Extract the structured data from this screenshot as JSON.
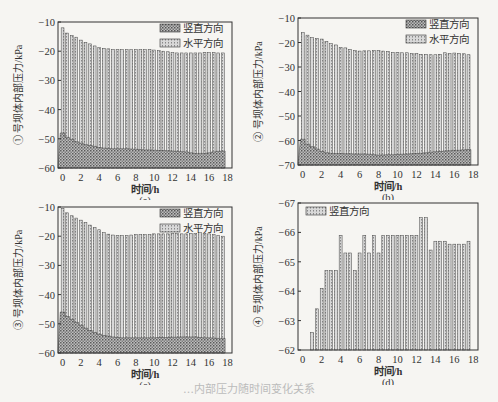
{
  "chart_data": [
    {
      "id": "a",
      "type": "bar",
      "title": "",
      "panel_label": "(a)",
      "xlabel": "时间/h",
      "ylabel": "① 号坝体内部压力/kPa",
      "ylim": [
        -60,
        -10
      ],
      "yticks": [
        -60,
        -50,
        -40,
        -30,
        -20,
        -10
      ],
      "xticks": [
        0,
        2,
        4,
        6,
        8,
        10,
        12,
        14,
        16,
        18
      ],
      "xlim": [
        -0.5,
        18.5
      ],
      "grid": false,
      "legend_position": "top-right",
      "legend": [
        "竖直方向",
        "水平方向"
      ],
      "x": [
        0,
        0.5,
        1,
        1.5,
        2,
        2.5,
        3,
        3.5,
        4,
        4.5,
        5,
        5.5,
        6,
        6.5,
        7,
        7.5,
        8,
        8.5,
        9,
        9.5,
        10,
        10.5,
        11,
        11.5,
        12,
        12.5,
        13,
        13.5,
        14,
        14.5,
        15,
        15.5,
        16,
        16.5,
        17,
        17.5
      ],
      "series": [
        {
          "name": "水平方向",
          "values": [
            -12,
            -13.8,
            -14.6,
            -15.2,
            -16.2,
            -17,
            -17.5,
            -18.2,
            -18.8,
            -19,
            -19.2,
            -19.4,
            -19.5,
            -19.5,
            -19.5,
            -19.5,
            -19.5,
            -19.5,
            -19.5,
            -19.4,
            -19.6,
            -19.8,
            -20,
            -20.2,
            -20.5,
            -20.6,
            -20.6,
            -20.6,
            -20.6,
            -20.6,
            -20.6,
            -20.4,
            -20.5,
            -20.5,
            -20.6,
            -20.6
          ]
        },
        {
          "name": "竖直方向",
          "values": [
            -48,
            -49.5,
            -50.2,
            -51,
            -51.5,
            -52,
            -52.3,
            -52.6,
            -53,
            -53.2,
            -53.3,
            -53.4,
            -53.4,
            -53.4,
            -53.4,
            -53.5,
            -53.6,
            -53.7,
            -53.8,
            -53.8,
            -53.9,
            -54,
            -54,
            -54.1,
            -54.2,
            -54.3,
            -54.4,
            -54.5,
            -54.8,
            -55,
            -55,
            -55,
            -54.8,
            -54.5,
            -54.3,
            -54.2
          ]
        }
      ]
    },
    {
      "id": "b",
      "type": "bar",
      "title": "",
      "panel_label": "(b)",
      "xlabel": "时间/h",
      "ylabel": "② 号坝体内部压力/kPa",
      "ylim": [
        -70,
        -10
      ],
      "yticks": [
        -70,
        -60,
        -50,
        -40,
        -30,
        -20,
        -10
      ],
      "xticks": [
        0,
        2,
        4,
        6,
        8,
        10,
        12,
        14,
        16,
        18
      ],
      "xlim": [
        -0.5,
        18.5
      ],
      "grid": false,
      "legend_position": "top-right",
      "legend": [
        "竖直方向",
        "水平方向"
      ],
      "x": [
        0,
        0.5,
        1,
        1.5,
        2,
        2.5,
        3,
        3.5,
        4,
        4.5,
        5,
        5.5,
        6,
        6.5,
        7,
        7.5,
        8,
        8.5,
        9,
        9.5,
        10,
        10.5,
        11,
        11.5,
        12,
        12.5,
        13,
        13.5,
        14,
        14.5,
        15,
        15.5,
        16,
        16.5,
        17,
        17.5
      ],
      "series": [
        {
          "name": "水平方向",
          "values": [
            -16,
            -17,
            -18,
            -18.3,
            -18.6,
            -19.5,
            -20.5,
            -21,
            -22,
            -22.2,
            -22.8,
            -23.3,
            -23.5,
            -23.4,
            -23.4,
            -23.2,
            -23.2,
            -23.5,
            -23.7,
            -24,
            -24,
            -24.2,
            -24.2,
            -24.5,
            -24.5,
            -24.8,
            -24.8,
            -25,
            -25,
            -24.8,
            -24.2,
            -24.5,
            -24.3,
            -24.4,
            -24.6,
            -25
          ]
        },
        {
          "name": "竖直方向",
          "values": [
            -59.5,
            -61.5,
            -62.5,
            -63.5,
            -64.5,
            -65,
            -65.2,
            -65.3,
            -65.3,
            -65.4,
            -65.4,
            -65.5,
            -65.5,
            -65.5,
            -65.6,
            -65.8,
            -66,
            -65.9,
            -65.8,
            -65.8,
            -65.7,
            -65.6,
            -65.5,
            -65.4,
            -65.3,
            -65.2,
            -65,
            -64.8,
            -64.6,
            -64.5,
            -64.3,
            -64.2,
            -64,
            -64,
            -63.8,
            -63.7
          ]
        }
      ]
    },
    {
      "id": "c",
      "type": "bar",
      "title": "",
      "panel_label": "(c)",
      "xlabel": "时间/h",
      "ylabel": "③ 号坝体内部压力/kPa",
      "ylim": [
        -60,
        -10
      ],
      "yticks": [
        -60,
        -50,
        -40,
        -30,
        -20,
        -10
      ],
      "xticks": [
        0,
        2,
        4,
        6,
        8,
        10,
        12,
        14,
        16,
        18
      ],
      "xlim": [
        -0.5,
        18.5
      ],
      "grid": false,
      "legend_position": "top-right",
      "legend": [
        "竖直方向",
        "水平方向"
      ],
      "x": [
        0,
        0.5,
        1,
        1.5,
        2,
        2.5,
        3,
        3.5,
        4,
        4.5,
        5,
        5.5,
        6,
        6.5,
        7,
        7.5,
        8,
        8.5,
        9,
        9.5,
        10,
        10.5,
        11,
        11.5,
        12,
        12.5,
        13,
        13.5,
        14,
        14.5,
        15,
        15.5,
        16,
        16.5,
        17,
        17.5
      ],
      "series": [
        {
          "name": "水平方向",
          "values": [
            -10.5,
            -12,
            -13,
            -13.8,
            -14.5,
            -15.3,
            -16.2,
            -17,
            -17.8,
            -18.8,
            -19.3,
            -19.6,
            -19.8,
            -19.8,
            -19.8,
            -19.6,
            -19.5,
            -19.5,
            -19.5,
            -19.5,
            -19.2,
            -19.2,
            -19.2,
            -19.2,
            -19,
            -19.1,
            -19.2,
            -19.2,
            -19,
            -19,
            -18.8,
            -19,
            -19.2,
            -19.5,
            -19.8,
            -20
          ]
        },
        {
          "name": "竖直方向",
          "values": [
            -46,
            -47.5,
            -48.5,
            -49.5,
            -50.5,
            -51.5,
            -52.3,
            -53,
            -53.6,
            -54,
            -54.2,
            -54.5,
            -54.7,
            -54.8,
            -54.8,
            -54.8,
            -54.8,
            -54.8,
            -54.8,
            -54.8,
            -54.8,
            -54.7,
            -54.7,
            -54.7,
            -54.6,
            -54.6,
            -54.5,
            -54.5,
            -54.5,
            -54.5,
            -54.7,
            -54.8,
            -54.8,
            -54.9,
            -55,
            -55
          ]
        }
      ]
    },
    {
      "id": "d",
      "type": "bar",
      "title": "",
      "panel_label": "(d)",
      "xlabel": "时间/h",
      "ylabel": "④ 号坝体内部压力/kPa",
      "ylim": [
        -62,
        -67
      ],
      "yticks": [
        -62,
        -63,
        -64,
        -65,
        -66,
        -67
      ],
      "xticks": [
        0,
        2,
        4,
        6,
        8,
        10,
        12,
        14,
        16,
        18
      ],
      "xlim": [
        -0.5,
        18.5
      ],
      "grid": false,
      "legend_position": "top-left",
      "legend": [
        "竖直方向"
      ],
      "x": [
        1,
        1.5,
        2,
        2.5,
        3,
        3.5,
        4,
        4.5,
        5,
        5.5,
        6,
        6.5,
        7,
        7.5,
        8,
        8.5,
        9,
        9.5,
        10,
        10.5,
        11,
        11.5,
        12,
        12.5,
        13,
        13.5,
        14,
        14.5,
        15,
        15.5,
        16,
        16.5,
        17,
        17.5
      ],
      "series": [
        {
          "name": "竖直方向",
          "values": [
            -62.6,
            -63.4,
            -64.1,
            -64.7,
            -64.7,
            -64.7,
            -65.9,
            -65.3,
            -65.3,
            -64.7,
            -65.3,
            -65.9,
            -65.3,
            -65.9,
            -65.3,
            -65.9,
            -65.9,
            -65.9,
            -65.9,
            -65.9,
            -65.9,
            -65.9,
            -65.9,
            -66.5,
            -66.5,
            -65.4,
            -65.7,
            -65.7,
            -65.7,
            -65.6,
            -65.6,
            -65.6,
            -65.6,
            -65.7
          ]
        }
      ]
    }
  ],
  "figure": {
    "caption": "…内部压力随时间变化关系"
  }
}
